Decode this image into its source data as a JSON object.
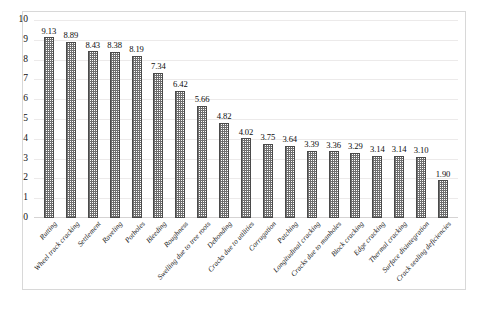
{
  "chart_data": {
    "type": "bar",
    "title": "",
    "subtitle": "",
    "xlabel": "",
    "ylabel": "",
    "ylim": [
      0,
      10
    ],
    "ytick_labels": [
      "10",
      "9",
      "8",
      "7",
      "6",
      "5",
      "4",
      "3",
      "2",
      "1",
      "0"
    ],
    "yticks": [
      10,
      9,
      8,
      7,
      6,
      5,
      4,
      3,
      2,
      1,
      0
    ],
    "grid": true,
    "grid_axis": "y",
    "legend": null,
    "legend_position": "none",
    "orientation": "vertical",
    "sorted": "descending",
    "bar_fill": "checkered-gray-pattern",
    "bar_edge_color": "#4a4a4a",
    "categories": [
      "Rutting",
      "Wheel track cracking",
      "Settlement",
      "Raveling",
      "Potholes",
      "Bleeding",
      "Roughness",
      "Swelling due to tree roots",
      "Debonding",
      "Cracks due to utilities",
      "Corrugation",
      "Patching",
      "Longitudinal cracking",
      "Cracks due to manholes",
      "Block cracking",
      "Edge cracking",
      "Thermal cracking",
      "Surface disintegration",
      "Crack sealing deficiencies"
    ],
    "values": [
      9.13,
      8.89,
      8.43,
      8.38,
      8.19,
      7.34,
      6.42,
      5.66,
      4.82,
      4.02,
      3.75,
      3.64,
      3.39,
      3.36,
      3.29,
      3.14,
      3.14,
      3.1,
      1.9
    ],
    "value_labels": [
      "9.13",
      "8.89",
      "8.43",
      "8.38",
      "8.19",
      "7.34",
      "6.42",
      "5.66",
      "4.82",
      "4.02",
      "3.75",
      "3.64",
      "3.39",
      "3.36",
      "3.29",
      "3.14",
      "3.14",
      "3.10",
      "1.90"
    ]
  }
}
